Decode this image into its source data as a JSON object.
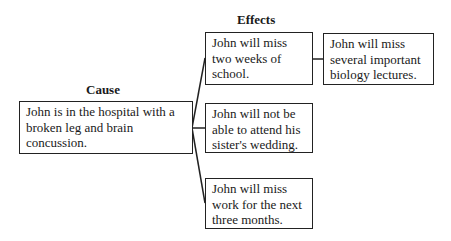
{
  "diagram": {
    "type": "cause-effect",
    "cause": {
      "heading": "Cause",
      "text": "John is in the hospital with a broken leg and brain concussion."
    },
    "effects": {
      "heading": "Effects",
      "items": [
        {
          "text": "John will miss two weeks of school."
        },
        {
          "text": "John will not be able to attend his sister's wedding."
        },
        {
          "text": "John will miss work for the next three months."
        }
      ],
      "secondary": [
        {
          "from": 0,
          "text": "John will miss several important biology lectures."
        }
      ]
    },
    "colors": {
      "line": "#222222",
      "text": "#1a1a1a",
      "background": "#ffffff"
    }
  }
}
